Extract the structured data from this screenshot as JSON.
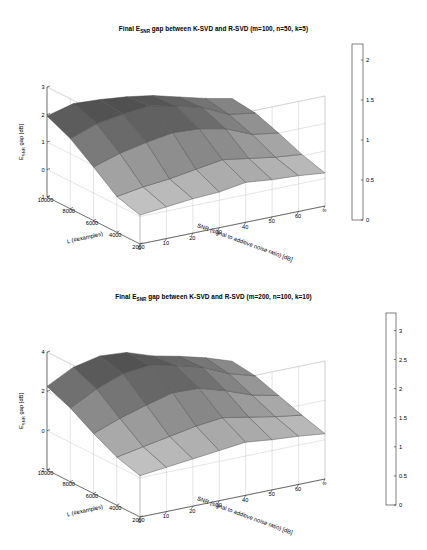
{
  "figure": {
    "background_color": "#ffffff",
    "mesh_edge_color": "#4d4d4d",
    "axis_color": "#000000",
    "box_color": "#bdbdbd"
  },
  "charts": [
    {
      "id": "chart-top",
      "type": "surface",
      "title_prefix": "Final E",
      "title_sub": "SNR",
      "title_suffix": " gap between K-SVD and R-SVD (m=100, n=50, k=5)",
      "title_full": "Final E_SNR gap between K-SVD and R-SVD (m=100, n=50, k=5)",
      "zlabel_prefix": "E",
      "zlabel_sub": "SNR",
      "zlabel_suffix": " gap [dB]",
      "zlabel_full": "E_SNR gap [dB]",
      "xlabel": "SNR (signal to additive noise ratio) [dB]",
      "ylabel": "L (#examples)",
      "x_ticks": [
        "0",
        "10",
        "20",
        "30",
        "40",
        "50",
        "60",
        "∞"
      ],
      "y_ticks": [
        "10000",
        "8000",
        "6000",
        "4000",
        "2000"
      ],
      "z_ticks": [
        "-1",
        "0",
        "1",
        "2",
        "3"
      ],
      "zlim": [
        -1,
        3
      ],
      "grid": true,
      "colorbar": {
        "ticks": [
          "0",
          "0.5",
          "1",
          "1.5",
          "2"
        ],
        "min": 0,
        "max": 2.2,
        "colormap": "gray-inverted",
        "light_color": "#cfcfcf",
        "dark_color": "#4a4a4a"
      },
      "chart_data": {
        "type": "surface",
        "title": "Final E_SNR gap between K-SVD and R-SVD (m=100, n=50, k=5)",
        "xlabel": "SNR (signal to additive noise ratio) [dB]",
        "ylabel": "L (#examples)",
        "zlabel": "E_SNR gap [dB]",
        "x": [
          0,
          10,
          20,
          30,
          40,
          50,
          60,
          70
        ],
        "x_tick_labels": [
          "0",
          "10",
          "20",
          "30",
          "40",
          "50",
          "60",
          "∞"
        ],
        "y": [
          2000,
          4000,
          6000,
          8000,
          10000
        ],
        "zlim": [
          -1,
          3
        ],
        "clim": [
          0,
          2.2
        ],
        "z": [
          [
            0.05,
            0.15,
            0.25,
            0.3,
            0.45,
            0.35,
            0.3,
            0.2
          ],
          [
            0.3,
            0.45,
            0.55,
            0.7,
            0.85,
            0.7,
            0.55,
            0.45
          ],
          [
            0.95,
            1.25,
            1.45,
            1.6,
            1.55,
            1.35,
            0.95,
            0.8
          ],
          [
            1.55,
            1.9,
            2.05,
            2.15,
            1.95,
            1.7,
            1.25,
            1.1
          ],
          [
            1.95,
            2.2,
            2.15,
            2.05,
            1.9,
            1.65,
            1.4,
            1.2
          ]
        ]
      }
    },
    {
      "id": "chart-bottom",
      "type": "surface",
      "title_prefix": "Final E",
      "title_sub": "SNR",
      "title_suffix": " gap between K-SVD and R-SVD (m=200, n=100, k=10)",
      "title_full": "Final E_SNR gap between K-SVD and R-SVD (m=200, n=100, k=10)",
      "zlabel_prefix": "E",
      "zlabel_sub": "SNR",
      "zlabel_suffix": " gap [dB]",
      "zlabel_full": "E_SNR gap [dB]",
      "xlabel": "SNR (signal to additive noise ratio) [dB]",
      "ylabel": "L (#examples)",
      "x_ticks": [
        "0",
        "10",
        "20",
        "30",
        "40",
        "50",
        "60",
        "∞"
      ],
      "y_ticks": [
        "10000",
        "8000",
        "6000",
        "4000",
        "2000"
      ],
      "z_ticks": [
        "-2",
        "0",
        "2",
        "4"
      ],
      "zlim": [
        -2,
        4
      ],
      "grid": true,
      "colorbar": {
        "ticks": [
          "0",
          "0.5",
          "1",
          "1.5",
          "2",
          "2.5",
          "3"
        ],
        "min": 0,
        "max": 3.3,
        "colormap": "gray-inverted",
        "light_color": "#cfcfcf",
        "dark_color": "#4a4a4a"
      },
      "chart_data": {
        "type": "surface",
        "title": "Final E_SNR gap between K-SVD and R-SVD (m=200, n=100, k=10)",
        "xlabel": "SNR (signal to additive noise ratio) [dB]",
        "ylabel": "L (#examples)",
        "zlabel": "E_SNR gap [dB]",
        "x": [
          0,
          10,
          20,
          30,
          40,
          50,
          60,
          70
        ],
        "x_tick_labels": [
          "0",
          "10",
          "20",
          "30",
          "40",
          "50",
          "60",
          "∞"
        ],
        "y": [
          2000,
          4000,
          6000,
          8000,
          10000
        ],
        "zlim": [
          -2,
          4
        ],
        "clim": [
          0,
          3.3
        ],
        "z": [
          [
            0.1,
            0.25,
            0.4,
            0.55,
            0.7,
            0.55,
            0.45,
            0.3
          ],
          [
            0.45,
            0.7,
            0.95,
            1.2,
            1.35,
            1.1,
            0.85,
            0.65
          ],
          [
            1.05,
            1.55,
            1.95,
            2.3,
            2.25,
            1.85,
            1.35,
            1.05
          ],
          [
            1.75,
            2.45,
            2.95,
            3.1,
            2.8,
            2.45,
            1.85,
            1.45
          ],
          [
            2.25,
            2.95,
            3.25,
            3.15,
            2.7,
            2.4,
            2.05,
            1.6
          ]
        ]
      }
    }
  ]
}
